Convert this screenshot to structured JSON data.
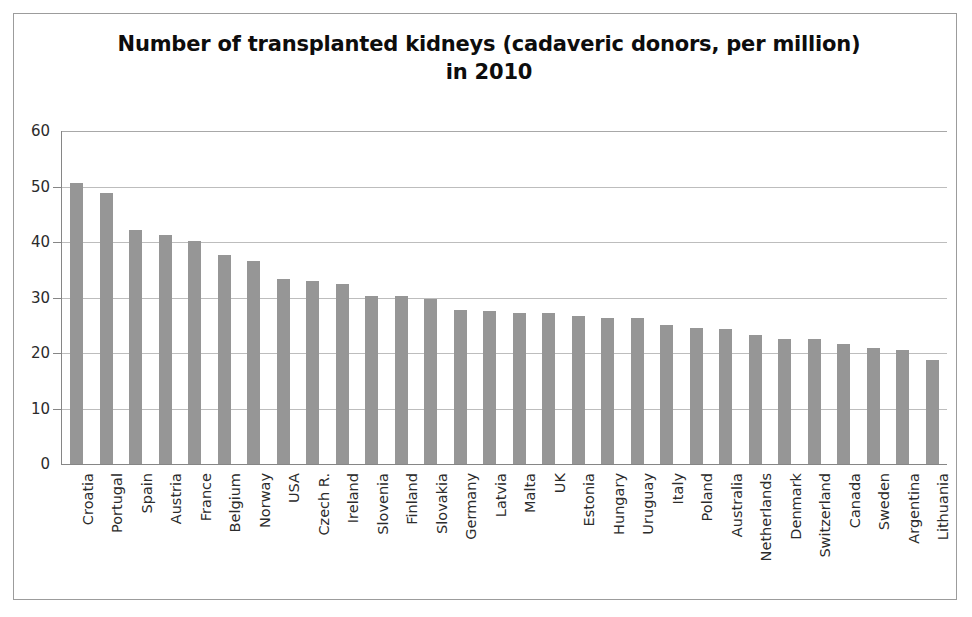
{
  "chart_data": {
    "type": "bar",
    "title": "Number of transplanted kidneys (cadaveric donors, per million) in 2010",
    "xlabel": "",
    "ylabel": "",
    "ylim": [
      0,
      60
    ],
    "yticks": [
      0,
      10,
      20,
      30,
      40,
      50,
      60
    ],
    "grid": true,
    "legend": false,
    "bar_color": "#969696",
    "categories": [
      "Croatia",
      "Portugal",
      "Spain",
      "Austria",
      "France",
      "Belgium",
      "Norway",
      "USA",
      "Czech R.",
      "Ireland",
      "Slovenia",
      "Finland",
      "Slovakia",
      "Germany",
      "Latvia",
      "Malta",
      "UK",
      "Estonia",
      "Hungary",
      "Uruguay",
      "Italy",
      "Poland",
      "Australia",
      "Netherlands",
      "Denmark",
      "Switzerland",
      "Canada",
      "Sweden",
      "Argentina",
      "Lithuania"
    ],
    "values": [
      50.7,
      48.8,
      42.1,
      41.2,
      40.1,
      37.6,
      36.6,
      33.3,
      32.9,
      32.5,
      30.2,
      30.2,
      29.8,
      27.7,
      27.6,
      27.2,
      27.2,
      26.7,
      26.3,
      26.3,
      25.0,
      24.5,
      24.3,
      23.3,
      22.6,
      22.5,
      21.6,
      20.9,
      20.6,
      18.7
    ]
  }
}
